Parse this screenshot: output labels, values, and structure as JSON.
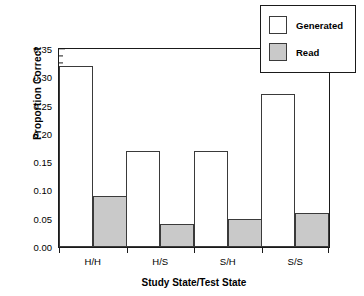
{
  "chart_data": {
    "type": "bar",
    "title": "",
    "xlabel": "Study State/Test State",
    "ylabel": "Proportion Correct",
    "categories": [
      "H/H",
      "H/S",
      "S/H",
      "S/S"
    ],
    "series": [
      {
        "name": "Generated",
        "values": [
          0.32,
          0.17,
          0.17,
          0.27
        ],
        "color": "#ffffff"
      },
      {
        "name": "Read",
        "values": [
          0.09,
          0.04,
          0.05,
          0.06
        ],
        "color": "#c9c9c9"
      }
    ],
    "ylim": [
      0.0,
      0.35
    ],
    "ytick_values": [
      0.0,
      0.05,
      0.1,
      0.15,
      0.2,
      0.25,
      0.3,
      0.35
    ],
    "ytick_labels": [
      "0.00",
      "0.05",
      "0.10",
      "0.15",
      "0.20",
      "0.25",
      "0.30",
      "0.35"
    ],
    "ytick_minor_step": 0.0125,
    "grid": false,
    "legend_position": "top-right",
    "legend_entries": [
      "Generated",
      "Read"
    ],
    "axis_color": "#1a1a1a",
    "bar_border_color": "#3a3a3a"
  }
}
